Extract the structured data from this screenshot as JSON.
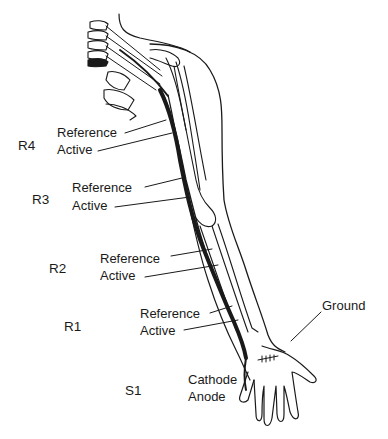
{
  "diagram": {
    "segments": [
      {
        "id": "R4",
        "label": "R4",
        "reference": "Reference",
        "active": "Active"
      },
      {
        "id": "R3",
        "label": "R3",
        "reference": "Reference",
        "active": "Active"
      },
      {
        "id": "R2",
        "label": "R2",
        "reference": "Reference",
        "active": "Active"
      },
      {
        "id": "R1",
        "label": "R1",
        "reference": "Reference",
        "active": "Active"
      }
    ],
    "stimulation": {
      "label": "S1",
      "cathode": "Cathode",
      "anode": "Anode"
    },
    "ground": "Ground",
    "colors": {
      "ink": "#1a1a1a",
      "background": "#ffffff"
    }
  }
}
